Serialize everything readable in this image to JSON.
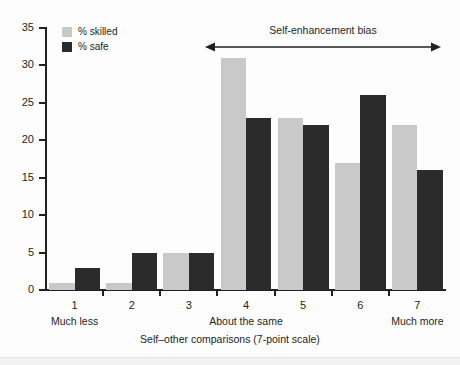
{
  "chart_data": {
    "type": "bar",
    "title": "",
    "xlabel": "Self–other comparisons (7-point scale)",
    "ylabel": "",
    "ylim": [
      0,
      35
    ],
    "yticks": [
      0,
      5,
      10,
      15,
      20,
      25,
      30,
      35
    ],
    "grid": false,
    "legend_position": "top-left",
    "categories": [
      "1",
      "2",
      "3",
      "4",
      "5",
      "6",
      "7"
    ],
    "category_sublabels": {
      "1": "Much less",
      "4": "About the same",
      "7": "Much more"
    },
    "series": [
      {
        "name": "% skilled",
        "color": "#c9c9c9",
        "values": [
          1,
          1,
          5,
          31,
          23,
          17,
          22
        ]
      },
      {
        "name": "% safe",
        "color": "#2b2b2b",
        "values": [
          3,
          5,
          5,
          23,
          22,
          26,
          16
        ]
      }
    ],
    "annotations": [
      {
        "text": "Self-enhancement bias",
        "type": "double-arrow",
        "from_category": "4",
        "to_category": "7"
      }
    ]
  },
  "legend": {
    "items": [
      {
        "label": "% skilled",
        "color": "#c9c9c9"
      },
      {
        "label": "% safe",
        "color": "#2b2b2b"
      }
    ]
  },
  "axis": {
    "y_tick_labels": [
      "0",
      "5",
      "10",
      "15",
      "20",
      "25",
      "30",
      "35"
    ],
    "x_tick_labels": [
      "1",
      "2",
      "3",
      "4",
      "5",
      "6",
      "7"
    ],
    "x_sub_labels": [
      "Much less",
      "About the same",
      "Much more"
    ],
    "x_title": "Self–other comparisons (7-point scale)"
  },
  "annotation": {
    "label": "Self-enhancement bias"
  },
  "colors": {
    "skilled": "#c9c9c9",
    "safe": "#2b2b2b",
    "axis": "#231f20",
    "background": "#fdfdfd"
  }
}
